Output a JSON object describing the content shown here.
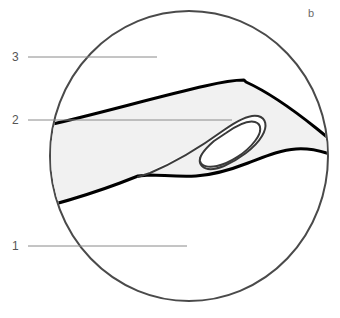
{
  "figure": {
    "panel_letter": "b",
    "background_color": "#ffffff",
    "field_of_view": {
      "name": "circular-field-of-view",
      "outline_color": "#4a4a4a",
      "outline_width": 2,
      "center_x": 189,
      "center_y": 156,
      "radius_x": 139,
      "radius_y": 145
    },
    "band": {
      "name": "shaded-band-structure",
      "fill_color": "#f1f1f1",
      "outline_color": "#000000",
      "outline_width": 3
    },
    "hook": {
      "name": "hook-fold-structure",
      "fill_color": "#ffffff",
      "outline_color": "#3a3a3a",
      "outline_width": 2
    },
    "callouts": [
      {
        "id": "callout-3",
        "label": "3",
        "label_x": 12,
        "label_y": 51,
        "line_x1": 28,
        "line_y1": 57,
        "line_x2": 157,
        "line_y2": 57,
        "line_color": "#8a8a8a"
      },
      {
        "id": "callout-2",
        "label": "2",
        "label_x": 12,
        "label_y": 114,
        "line_x1": 28,
        "line_y1": 120,
        "line_x2": 232,
        "line_y2": 120,
        "line_color": "#8a8a8a"
      },
      {
        "id": "callout-1",
        "label": "1",
        "label_x": 12,
        "label_y": 240,
        "line_x1": 28,
        "line_y1": 246,
        "line_x2": 187,
        "line_y2": 246,
        "line_color": "#8a8a8a"
      }
    ],
    "panel_letter_position": {
      "x": 308,
      "y": 8
    }
  }
}
